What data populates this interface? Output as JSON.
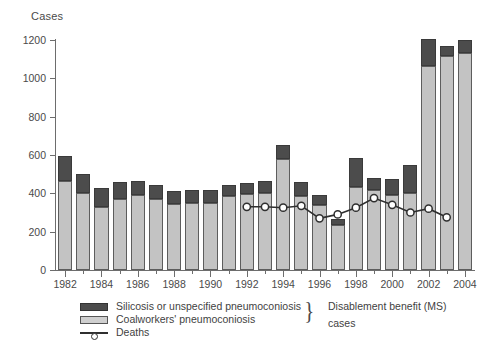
{
  "chart_data": {
    "type": "bar",
    "title": "",
    "xlabel": "",
    "ylabel": "Cases",
    "ylim": [
      0,
      1200
    ],
    "yticks": [
      0,
      200,
      400,
      600,
      800,
      1000,
      1200
    ],
    "ytick_labels": [
      "0",
      "200",
      "400",
      "600",
      "800",
      "1000",
      "1200"
    ],
    "grid": false,
    "stacked": true,
    "legend_position": "bottom-left",
    "categories": [
      "1982",
      "1983",
      "1984",
      "1985",
      "1986",
      "1987",
      "1988",
      "1989",
      "1990",
      "1991",
      "1992",
      "1993",
      "1994",
      "1995",
      "1996",
      "1997",
      "1998",
      "1999",
      "2000",
      "2001",
      "2002",
      "2003",
      "2004"
    ],
    "xtick_labels": [
      "1982",
      "1984",
      "1986",
      "1988",
      "1990",
      "1992",
      "1994",
      "1996",
      "1998",
      "2000",
      "2002",
      "2004"
    ],
    "series": [
      {
        "name": "Coalworkers' pneumoconiosis",
        "color": "#c3c3c3",
        "values": [
          465,
          400,
          330,
          370,
          390,
          370,
          345,
          350,
          350,
          385,
          395,
          400,
          580,
          385,
          340,
          235,
          435,
          420,
          390,
          400,
          1065,
          1115,
          1130
        ]
      },
      {
        "name": "Silicosis or unspecified pneumoconiosis",
        "color": "#4c4c4c",
        "values": [
          130,
          100,
          100,
          90,
          75,
          75,
          65,
          65,
          65,
          60,
          60,
          65,
          70,
          75,
          50,
          30,
          150,
          60,
          85,
          150,
          140,
          55,
          70
        ]
      }
    ],
    "stack_totals": [
      595,
      500,
      430,
      460,
      465,
      445,
      410,
      415,
      415,
      445,
      455,
      465,
      650,
      460,
      390,
      265,
      585,
      480,
      475,
      550,
      1205,
      1170,
      1200
    ],
    "line_series": {
      "name": "Deaths",
      "marker": "circle-open",
      "color": "#2f2f2f",
      "x": [
        "1992",
        "1993",
        "1994",
        "1995",
        "1996",
        "1997",
        "1998",
        "1999",
        "2000",
        "2001",
        "2002",
        "2003"
      ],
      "values": [
        330,
        330,
        325,
        335,
        270,
        290,
        325,
        375,
        340,
        300,
        320,
        275
      ]
    },
    "annotation": {
      "brace": "}",
      "lines": [
        "Disablement benefit (MS)",
        "cases"
      ]
    }
  },
  "legend": {
    "items": [
      {
        "label": "Silicosis or unspecified pneumoconiosis",
        "swatch": "dark-square-icon"
      },
      {
        "label": "Coalworkers' pneumoconiosis",
        "swatch": "light-square-icon"
      },
      {
        "label": "Deaths",
        "swatch": "line-marker-icon"
      }
    ]
  }
}
